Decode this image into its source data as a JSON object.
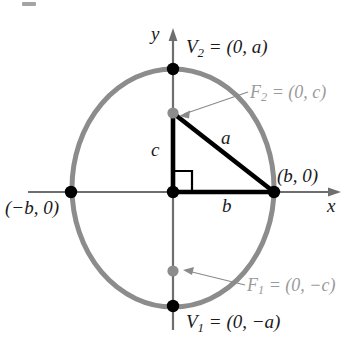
{
  "figure": {
    "type": "ellipse-with-foci-diagram",
    "axes": {
      "x_label": "x",
      "y_label": "y"
    },
    "colors": {
      "ellipse": "#8c8c8c",
      "triangle": "#000000",
      "vertex_dot": "#000000",
      "focus_dot": "#8c8c8c",
      "focus_label": "#9a9a9a",
      "axis": "#6e6e6e",
      "leader": "#8a8a8a",
      "background": "#ffffff"
    },
    "labels": {
      "vertex_top": "V₂ = (0, a)",
      "vertex_top_text": "V",
      "vertex_top_sub": "2",
      "vertex_top_rest": " = (0, a)",
      "vertex_bottom_text": "V",
      "vertex_bottom_sub": "1",
      "vertex_bottom_rest": " = (0, −a)",
      "focus_top_text": "F",
      "focus_top_sub": "2",
      "focus_top_rest": " = (0, c)",
      "focus_bottom_text": "F",
      "focus_bottom_sub": "1",
      "focus_bottom_rest": " = (0, −c)",
      "covertex_right": "(b, 0)",
      "covertex_left": "(−b, 0)",
      "leg_vertical": "c",
      "leg_horizontal": "b",
      "hypotenuse": "a"
    },
    "geometry": {
      "origin_x": 173,
      "origin_y": 192,
      "semi_minor_b_px": 101,
      "semi_major_a_px": 114,
      "focus_offset_c_px": 79,
      "vertex_top": [
        0,
        124
      ],
      "vertex_bottom": [
        0,
        -114
      ],
      "covertex_right": [
        101,
        0
      ],
      "covertex_left": [
        -101,
        0
      ],
      "focus_top": [
        0,
        79
      ],
      "focus_bottom": [
        0,
        -79
      ]
    }
  }
}
